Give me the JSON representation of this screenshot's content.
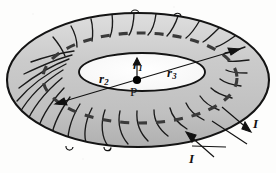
{
  "figure": {
    "kind": "physics-diagram",
    "background_color": "#fdfdfc"
  },
  "colors": {
    "torus_fill": "#c9c9c9",
    "torus_fill_light": "#d8d8d8",
    "torus_fill_dark": "#b4b4b4",
    "hole_fill": "#ffffff",
    "outline": "#141414",
    "winding": "#1a1a1a",
    "dashed_loop": "#3a3a3a",
    "label": "#111111",
    "point_marker": "#000000"
  },
  "labels": {
    "r1": {
      "text": "r",
      "subscript": "1",
      "role": "radius-inner-to-point"
    },
    "r2": {
      "text": "r",
      "subscript": "2",
      "role": "radius-left"
    },
    "r3": {
      "text": "r",
      "subscript": "3",
      "role": "radius-right"
    },
    "point_p": {
      "text": "P",
      "role": "center-point"
    },
    "current_right": {
      "text": "I",
      "role": "current-out"
    },
    "current_bottom": {
      "text": "I",
      "role": "current-in"
    }
  },
  "geometry": {
    "outer_ellipse": {
      "cx": 138,
      "cy": 80,
      "rx": 131,
      "ry": 67
    },
    "inner_hole_ellipse": {
      "cx": 142,
      "cy": 72,
      "rx": 63,
      "ry": 19
    },
    "point_p": {
      "x": 137,
      "y": 80
    },
    "diameter_arrow": {
      "x1": 56,
      "y1": 104,
      "x2": 239,
      "y2": 49
    },
    "r1_arrow": {
      "x1": 137,
      "y1": 79,
      "x2": 137,
      "y2": 60
    },
    "winding_count": 26
  }
}
